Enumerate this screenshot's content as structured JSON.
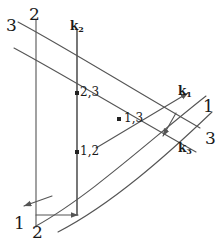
{
  "figure": {
    "type": "vector-line-diagram",
    "width": 223,
    "height": 248,
    "background_color": "#ffffff",
    "stroke_color": "#555555",
    "text_color": "#1a1a1a"
  },
  "labels": {
    "family_3_top": "3",
    "family_2_top": "2",
    "vector_k2": "k",
    "vector_k2_sub": "2",
    "vector_k1": "k",
    "vector_k1_sub": "1",
    "vector_k3": "k",
    "vector_k3_sub": "3",
    "family_1_right": "1",
    "family_3_right": "3",
    "family_1_bottom": "1",
    "family_2_bottom": "2",
    "point_23": "2,3",
    "point_13": "1,3",
    "point_12": "1,2"
  },
  "geometry": {
    "vertical_line_2": {
      "x": 36,
      "y_top": 20,
      "y_bottom": 227
    },
    "vertical_line_k2": {
      "x": 77,
      "y_top": 30,
      "y_bottom": 215
    },
    "curve_3_upper": "M 18,22 C 70,50 130,88 200,128",
    "curve_3_lower": "M 14,48 C 66,76 128,114 196,152",
    "curve_1_upper": "M 36,226 C 90,196 150,140 206,96",
    "curve_1_lower": "M 58,232 C 112,204 166,156 212,112",
    "arrow_k1": {
      "x1": 96,
      "y1": 148,
      "x2": 188,
      "y2": 93
    },
    "arrow_k3": {
      "x1": 176,
      "y1": 113,
      "x2": 163,
      "y2": 136
    },
    "arrow_k2_base": {
      "x": 77,
      "y1": 215,
      "y2": 30
    },
    "arrow_horizontal": {
      "x1": 36,
      "y1": 215,
      "x2": 78,
      "y2": 215
    },
    "arrow_diagonal_bottomleft": {
      "x1": 52,
      "y1": 196,
      "x2": 24,
      "y2": 206
    },
    "dots": [
      {
        "name": "point-23",
        "x": 77,
        "y": 93
      },
      {
        "name": "point-13",
        "x": 119,
        "y": 119
      },
      {
        "name": "point-12",
        "x": 77,
        "y": 152
      }
    ]
  },
  "label_positions": {
    "family_3_top": {
      "left": 6,
      "top": 17
    },
    "family_2_top": {
      "left": 29,
      "top": 6
    },
    "vector_k2": {
      "left": 70,
      "top": 20
    },
    "vector_k1": {
      "left": 178,
      "top": 85
    },
    "vector_k3": {
      "left": 178,
      "top": 142
    },
    "family_1_right": {
      "left": 203,
      "top": 98
    },
    "family_3_right": {
      "left": 205,
      "top": 130
    },
    "family_1_bottom": {
      "left": 14,
      "top": 215
    },
    "family_2_bottom": {
      "left": 32,
      "top": 224
    },
    "point_23": {
      "left": 80,
      "top": 86
    },
    "point_13": {
      "left": 124,
      "top": 112
    },
    "point_12": {
      "left": 80,
      "top": 145
    }
  }
}
